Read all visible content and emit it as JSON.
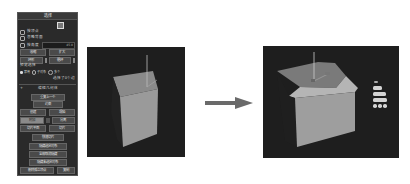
{
  "panel": {
    "title": "选择",
    "checkboxes": [
      {
        "label": "按顶点",
        "checked": false
      },
      {
        "label": "忽略背面",
        "checked": false
      },
      {
        "label": "按角度",
        "checked": false,
        "value": "45.0"
      }
    ],
    "buttons_row1": [
      "收缩",
      "扩大"
    ],
    "buttons_row2": [
      "环形",
      "循环"
    ],
    "preview": {
      "label": "预览选择",
      "options": [
        "禁用",
        "子对象",
        "多个"
      ],
      "selected": "禁用"
    },
    "status": "选择了0个边",
    "edit_section": {
      "title": "编辑几何体",
      "buttons": [
        "重复上一个",
        "约束",
        "保持UV",
        "创建",
        "塌陷",
        "附加",
        "分离",
        "切片平面",
        "切片",
        "快速切片",
        "切割",
        "网格平滑",
        "细化",
        "平面化",
        "视图对齐",
        "栅格对齐",
        "隐藏选定对象",
        "全部取消隐藏",
        "隐藏未选定对象",
        "删除孤立顶点",
        "复制"
      ]
    }
  },
  "viewport_before": {
    "object": "box",
    "state": "original"
  },
  "arrow": {
    "direction": "right",
    "icon": "arrow-right-icon"
  },
  "viewport_after": {
    "object": "box",
    "state": "top-edge chamfered",
    "caddy": {
      "labels": [
        "",
        "",
        ""
      ],
      "icons": [
        "ok-icon",
        "apply-icon",
        "cancel-icon"
      ]
    }
  }
}
